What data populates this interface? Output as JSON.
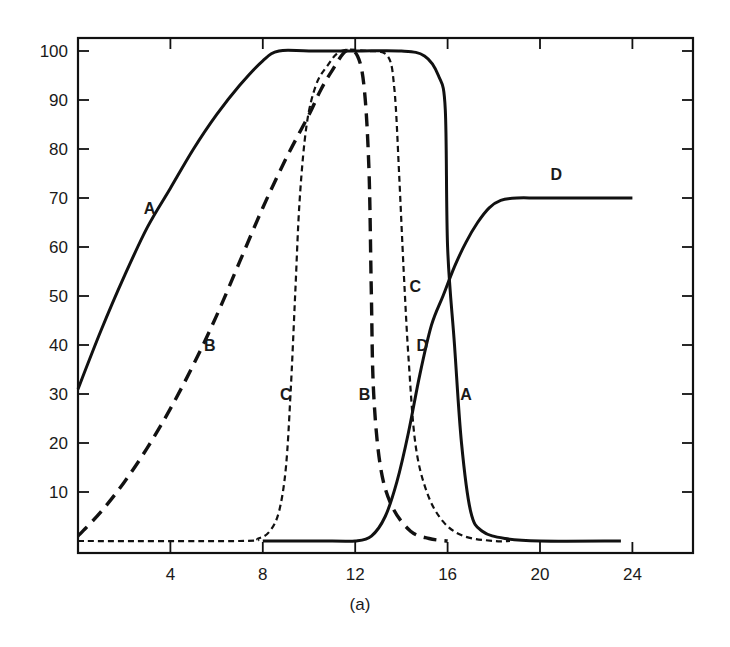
{
  "chart_data": {
    "type": "line",
    "title": "",
    "caption": "(a)",
    "xlabel": "",
    "ylabel": "",
    "xlim": [
      0,
      27
    ],
    "ylim": [
      -3,
      103
    ],
    "x_ticks": [
      4,
      8,
      12,
      16,
      20,
      24
    ],
    "y_ticks": [
      10,
      20,
      30,
      40,
      50,
      60,
      70,
      80,
      90,
      100
    ],
    "grid": false,
    "legend": "none (curves labeled inline A, B, C, D)",
    "series": [
      {
        "name": "A",
        "style": "solid",
        "points": [
          [
            0,
            31
          ],
          [
            1,
            43
          ],
          [
            2,
            54
          ],
          [
            3,
            64
          ],
          [
            4,
            72
          ],
          [
            5,
            80
          ],
          [
            6,
            87
          ],
          [
            7,
            93
          ],
          [
            8,
            98
          ],
          [
            8.7,
            100
          ],
          [
            10,
            100
          ],
          [
            12,
            100
          ],
          [
            14,
            100
          ],
          [
            15,
            99
          ],
          [
            15.6,
            95
          ],
          [
            15.9,
            88
          ],
          [
            16.0,
            60
          ],
          [
            16.3,
            40
          ],
          [
            16.6,
            20
          ],
          [
            17,
            6
          ],
          [
            17.5,
            2
          ],
          [
            18.5,
            0.5
          ],
          [
            20,
            0
          ],
          [
            23.5,
            0
          ]
        ]
      },
      {
        "name": "B",
        "style": "long-dash",
        "points": [
          [
            0,
            1
          ],
          [
            1,
            6
          ],
          [
            2,
            12
          ],
          [
            3,
            19
          ],
          [
            4,
            27
          ],
          [
            5,
            36
          ],
          [
            6,
            46
          ],
          [
            7,
            57
          ],
          [
            8,
            68
          ],
          [
            9,
            78
          ],
          [
            10,
            87
          ],
          [
            10.5,
            92
          ],
          [
            11,
            96
          ],
          [
            11.6,
            100
          ],
          [
            12.1,
            99
          ],
          [
            12.4,
            92
          ],
          [
            12.6,
            75
          ],
          [
            12.7,
            50
          ],
          [
            12.8,
            30
          ],
          [
            13.1,
            15
          ],
          [
            13.6,
            7
          ],
          [
            14.4,
            2
          ],
          [
            15.2,
            0.5
          ],
          [
            16,
            0
          ]
        ]
      },
      {
        "name": "C",
        "style": "short-dash",
        "points": [
          [
            0,
            0
          ],
          [
            7,
            0
          ],
          [
            7.8,
            0.5
          ],
          [
            8.3,
            2
          ],
          [
            8.7,
            6
          ],
          [
            9.0,
            15
          ],
          [
            9.2,
            30
          ],
          [
            9.4,
            50
          ],
          [
            9.6,
            70
          ],
          [
            9.9,
            85
          ],
          [
            10.3,
            93
          ],
          [
            10.8,
            97
          ],
          [
            11.4,
            100
          ],
          [
            12.5,
            100
          ],
          [
            13.4,
            99
          ],
          [
            13.7,
            92
          ],
          [
            13.9,
            75
          ],
          [
            14.1,
            55
          ],
          [
            14.3,
            38
          ],
          [
            14.6,
            20
          ],
          [
            15.1,
            10
          ],
          [
            15.8,
            4
          ],
          [
            16.7,
            1
          ],
          [
            18,
            0
          ],
          [
            18.7,
            0
          ]
        ]
      },
      {
        "name": "D",
        "style": "solid",
        "points": [
          [
            8,
            0
          ],
          [
            11,
            0
          ],
          [
            12,
            0
          ],
          [
            12.7,
            1
          ],
          [
            13.3,
            5
          ],
          [
            13.8,
            12
          ],
          [
            14.3,
            22
          ],
          [
            14.8,
            34
          ],
          [
            15.3,
            44
          ],
          [
            15.8,
            50
          ],
          [
            16.3,
            56
          ],
          [
            16.8,
            61
          ],
          [
            17.3,
            65
          ],
          [
            17.8,
            68
          ],
          [
            18.3,
            69.5
          ],
          [
            19,
            70
          ],
          [
            20,
            70
          ],
          [
            22,
            70
          ],
          [
            24,
            70
          ]
        ]
      }
    ],
    "annotations": [
      {
        "text": "A",
        "x": 3.1,
        "y": 68
      },
      {
        "text": "A",
        "x": 16.8,
        "y": 30
      },
      {
        "text": "B",
        "x": 5.7,
        "y": 40
      },
      {
        "text": "B",
        "x": 12.4,
        "y": 30
      },
      {
        "text": "C",
        "x": 9.0,
        "y": 30
      },
      {
        "text": "C",
        "x": 14.6,
        "y": 52
      },
      {
        "text": "D",
        "x": 14.9,
        "y": 40
      },
      {
        "text": "D",
        "x": 20.7,
        "y": 75
      }
    ]
  }
}
